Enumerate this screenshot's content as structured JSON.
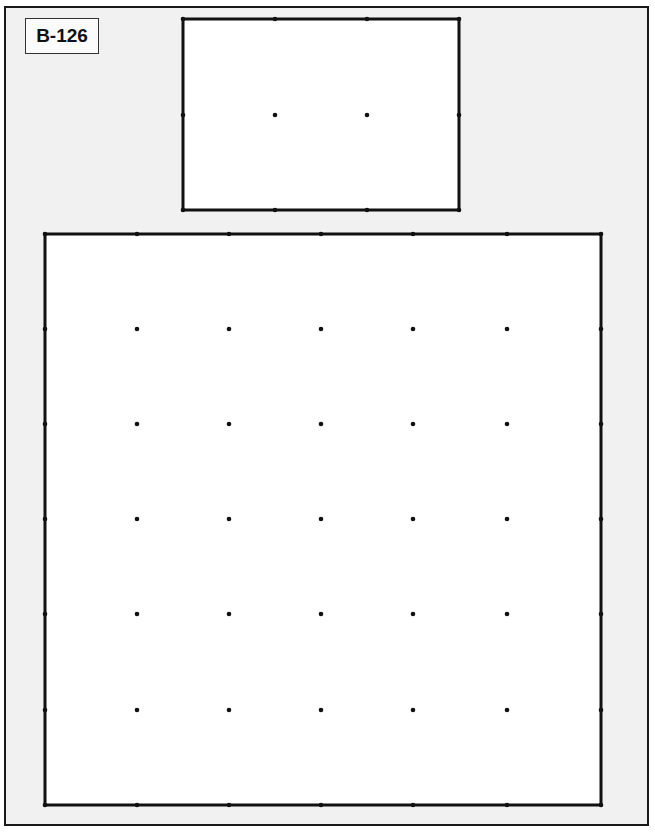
{
  "card": {
    "label": "B-126",
    "frame_color": "#1a1a1a",
    "background_color": "#f1f1f1"
  },
  "geoboards": [
    {
      "name": "small-geoboard",
      "columns": 4,
      "rows": 3,
      "x": [
        183,
        275,
        367,
        459
      ],
      "y": [
        19,
        115,
        210
      ]
    },
    {
      "name": "large-geoboard",
      "columns": 7,
      "rows": 7,
      "x": [
        45,
        137,
        229,
        321,
        413,
        507,
        601
      ],
      "y": [
        234,
        329,
        424,
        519,
        614,
        710,
        805
      ]
    }
  ]
}
